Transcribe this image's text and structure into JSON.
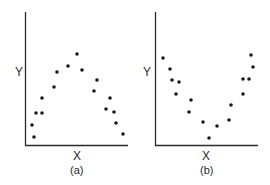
{
  "chart_data": [
    {
      "type": "scatter",
      "title": "",
      "caption": "(a)",
      "xlabel": "X",
      "ylabel": "Y",
      "shape": "inverted-U",
      "grid": false,
      "legend": null,
      "points": [
        {
          "x": 32,
          "y": 125
        },
        {
          "x": 34,
          "y": 137
        },
        {
          "x": 36,
          "y": 113
        },
        {
          "x": 42,
          "y": 98
        },
        {
          "x": 42,
          "y": 113
        },
        {
          "x": 54,
          "y": 87
        },
        {
          "x": 57,
          "y": 72
        },
        {
          "x": 68,
          "y": 66
        },
        {
          "x": 77,
          "y": 54
        },
        {
          "x": 82,
          "y": 70
        },
        {
          "x": 97,
          "y": 80
        },
        {
          "x": 94,
          "y": 91
        },
        {
          "x": 110,
          "y": 98
        },
        {
          "x": 106,
          "y": 109
        },
        {
          "x": 114,
          "y": 112
        },
        {
          "x": 116,
          "y": 123
        },
        {
          "x": 123,
          "y": 134
        }
      ]
    },
    {
      "type": "scatter",
      "title": "",
      "caption": "(b)",
      "xlabel": "X",
      "ylabel": "Y",
      "shape": "U",
      "grid": false,
      "legend": null,
      "points": [
        {
          "x": 163,
          "y": 58
        },
        {
          "x": 170,
          "y": 69
        },
        {
          "x": 172,
          "y": 80
        },
        {
          "x": 179,
          "y": 82
        },
        {
          "x": 176,
          "y": 94
        },
        {
          "x": 191,
          "y": 100
        },
        {
          "x": 189,
          "y": 112
        },
        {
          "x": 203,
          "y": 122
        },
        {
          "x": 209,
          "y": 138
        },
        {
          "x": 217,
          "y": 126
        },
        {
          "x": 229,
          "y": 120
        },
        {
          "x": 231,
          "y": 105
        },
        {
          "x": 243,
          "y": 94
        },
        {
          "x": 243,
          "y": 79
        },
        {
          "x": 249,
          "y": 79
        },
        {
          "x": 251,
          "y": 55
        },
        {
          "x": 253,
          "y": 67
        }
      ]
    }
  ],
  "panels": {
    "a": {
      "xlabel": "X",
      "ylabel": "Y",
      "caption": "(a)"
    },
    "b": {
      "xlabel": "X",
      "ylabel": "Y",
      "caption": "(b)"
    }
  },
  "style": {
    "ink": "#1a1a1a",
    "background": "#ffffff"
  }
}
